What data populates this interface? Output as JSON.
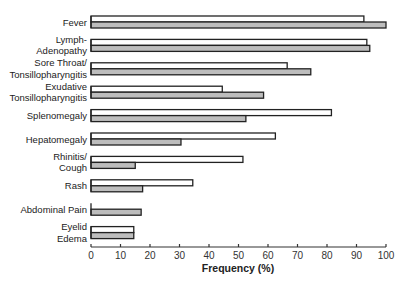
{
  "chart_data": {
    "type": "bar",
    "orientation": "horizontal",
    "title": "",
    "xlabel": "Frequency (%)",
    "ylabel": "",
    "xlim": [
      0,
      100
    ],
    "xticks": [
      0,
      10,
      20,
      30,
      40,
      50,
      60,
      70,
      80,
      90,
      100
    ],
    "grid": false,
    "legend": "none",
    "categories": [
      [
        "Fever"
      ],
      [
        "Lymph-",
        "Adenopathy"
      ],
      [
        "Sore Throat/",
        "Tonsillopharyngitis"
      ],
      [
        "Exudative",
        "Tonsillopharyngitis"
      ],
      [
        "Splenomegaly"
      ],
      [
        "Hepatomegaly"
      ],
      [
        "Rhinitis/",
        "Cough"
      ],
      [
        "Rash"
      ],
      [
        "Abdominal Pain"
      ],
      [
        "Eyelid",
        "Edema"
      ]
    ],
    "series": [
      {
        "name": "Series A (open bars)",
        "style": "white",
        "color": "#ffffff",
        "values": [
          92.5,
          93.5,
          66.5,
          44.5,
          81.5,
          62.5,
          51.5,
          34.5,
          0,
          14.5
        ]
      },
      {
        "name": "Series B (shaded bars)",
        "style": "gray",
        "color": "#bdbdbd",
        "values": [
          100,
          94.5,
          74.5,
          58.5,
          52.5,
          30.5,
          15,
          17.5,
          17,
          14.5
        ]
      }
    ]
  }
}
